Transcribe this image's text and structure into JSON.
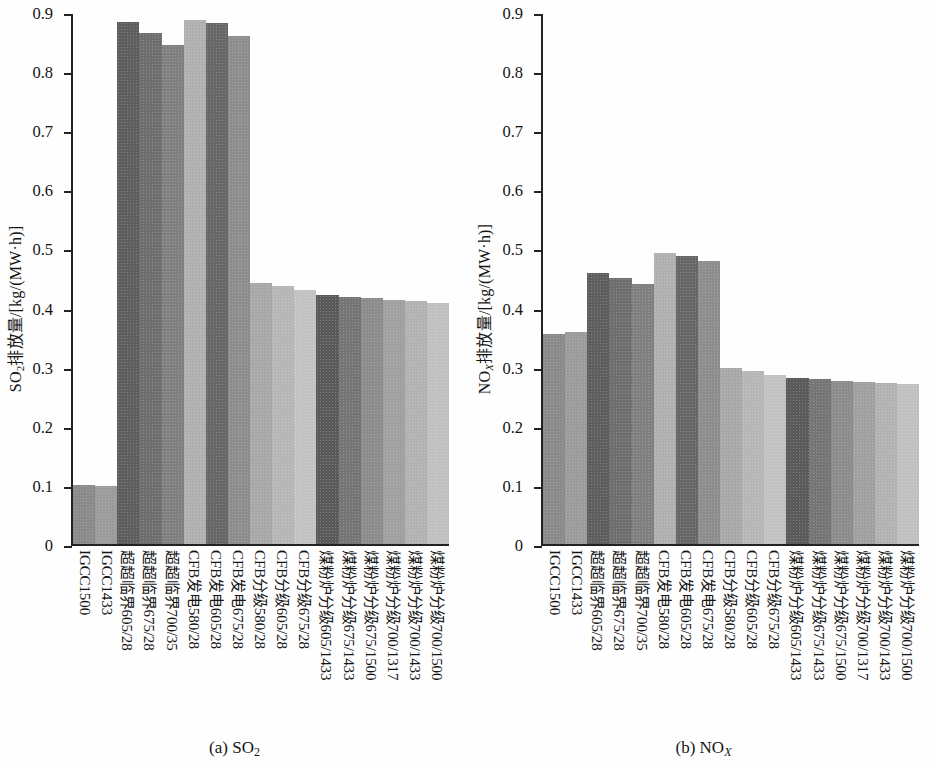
{
  "figure": {
    "panels": [
      {
        "id": "panel-a",
        "caption_prefix": "(a) SO",
        "caption_sub": "2",
        "caption_sub_italic": "",
        "ylabel_prefix": "SO",
        "ylabel_sub": "2",
        "ylabel_sub_italic": "",
        "ylabel_suffix": "排放量/[kg/(MW·h)]"
      },
      {
        "id": "panel-b",
        "caption_prefix": "(b) NO",
        "caption_sub": "",
        "caption_sub_italic": "X",
        "ylabel_prefix": "NO",
        "ylabel_sub": "",
        "ylabel_sub_italic": "X",
        "ylabel_suffix": "排放量/[kg/(MW·h)]"
      }
    ]
  },
  "chart_data": [
    {
      "type": "bar",
      "id": "so2",
      "title": "(a) SO2",
      "xlabel": "",
      "ylabel": "SO2排放量/[kg/(MW·h)]",
      "ylim": [
        0,
        0.9
      ],
      "ytick_labels": [
        "0.9",
        "0.8",
        "0.7",
        "0.6",
        "0.5",
        "0.4",
        "0.3",
        "0.2",
        "0.1",
        "0"
      ],
      "ytick_values": [
        0.9,
        0.8,
        0.7,
        0.6,
        0.5,
        0.4,
        0.3,
        0.2,
        0.1,
        0
      ],
      "grid": false,
      "legend": "none",
      "categories": [
        "IGCC1500",
        "IGCC1433",
        "超超临界605/28",
        "超超临界675/28",
        "超超临界700/35",
        "CFB发电580/28",
        "CFB发电605/28",
        "CFB发电675/28",
        "CFB分级580/28",
        "CFB分级605/28",
        "CFB分级675/28",
        "煤粉炉分级605/1433",
        "煤粉炉分级675/1433",
        "煤粉炉分级675/1500",
        "煤粉炉分级700/1317",
        "煤粉炉分级700/1433",
        "煤粉炉分级700/1500"
      ],
      "values": [
        0.1,
        0.098,
        0.883,
        0.864,
        0.845,
        0.887,
        0.882,
        0.86,
        0.441,
        0.436,
        0.429,
        0.421,
        0.418,
        0.416,
        0.413,
        0.411,
        0.408
      ],
      "bar_colors": [
        "#8a8a8a",
        "#9b9b9b",
        "#5e5e5e",
        "#6e6e6e",
        "#808080",
        "#b0b0b0",
        "#676767",
        "#8d8d8d",
        "#a8a8a8",
        "#b6b6b6",
        "#c2c2c2",
        "#5a5a5a",
        "#757575",
        "#8c8c8c",
        "#a0a0a0",
        "#b2b2b2",
        "#c0c0c0"
      ]
    },
    {
      "type": "bar",
      "id": "nox",
      "title": "(b) NOX",
      "xlabel": "",
      "ylabel": "NOX排放量/[kg/(MW·h)]",
      "ylim": [
        0,
        0.9
      ],
      "ytick_labels": [
        "0.9",
        "0.8",
        "0.7",
        "0.6",
        "0.5",
        "0.4",
        "0.3",
        "0.2",
        "0.1",
        "0"
      ],
      "ytick_values": [
        0.9,
        0.8,
        0.7,
        0.6,
        0.5,
        0.4,
        0.3,
        0.2,
        0.1,
        0
      ],
      "grid": false,
      "legend": "none",
      "categories": [
        "IGCC1500",
        "IGCC1433",
        "超超临界605/28",
        "超超临界675/28",
        "超超临界700/35",
        "CFB发电580/28",
        "CFB发电605/28",
        "CFB发电675/28",
        "CFB分级580/28",
        "CFB分级605/28",
        "CFB分级675/28",
        "煤粉炉分级605/1433",
        "煤粉炉分级675/1433",
        "煤粉炉分级675/1500",
        "煤粉炉分级700/1317",
        "煤粉炉分级700/1433",
        "煤粉炉分级700/1500"
      ],
      "values": [
        0.355,
        0.358,
        0.458,
        0.45,
        0.44,
        0.493,
        0.488,
        0.478,
        0.297,
        0.292,
        0.286,
        0.281,
        0.279,
        0.276,
        0.274,
        0.272,
        0.271
      ],
      "bar_colors": [
        "#8a8a8a",
        "#9b9b9b",
        "#5e5e5e",
        "#6e6e6e",
        "#808080",
        "#b0b0b0",
        "#676767",
        "#8d8d8d",
        "#a8a8a8",
        "#b6b6b6",
        "#c2c2c2",
        "#5a5a5a",
        "#757575",
        "#8c8c8c",
        "#a0a0a0",
        "#b2b2b2",
        "#c0c0c0"
      ]
    }
  ]
}
